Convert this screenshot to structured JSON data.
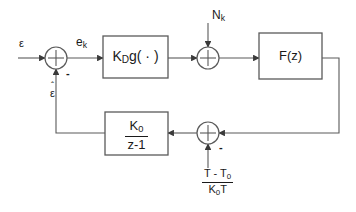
{
  "diagram": {
    "stroke_color": "#5a5a5a",
    "text_color": "#1a1a1a",
    "background": "#ffffff",
    "blocks": [
      {
        "id": "detector",
        "label_main": "K",
        "label_sub": "D",
        "label_tail": "g( · )",
        "x": 103,
        "y": 36,
        "w": 65,
        "h": 42
      },
      {
        "id": "filter",
        "label_main": "F(z)",
        "x": 259,
        "y": 33,
        "w": 63,
        "h": 46
      },
      {
        "id": "nco",
        "num_main": "K",
        "num_sub": "0",
        "den": "z-1",
        "x": 105,
        "y": 112,
        "w": 63,
        "h": 43
      }
    ],
    "summers": [
      {
        "id": "error-summer",
        "cx": 56,
        "cy": 58,
        "r": 11
      },
      {
        "id": "noise-summer",
        "cx": 208,
        "cy": 58,
        "r": 11
      },
      {
        "id": "offset-summer",
        "cx": 208,
        "cy": 133,
        "r": 11
      }
    ],
    "signal_labels": {
      "input_epsilon": "ε",
      "error_ek_main": "e",
      "error_ek_sub": "k",
      "noise_main": "N",
      "noise_sub": "k",
      "estimate_hat": "ˆ",
      "estimate_epsilon": "ε",
      "minus_error": "-",
      "minus_offset": "-",
      "offset_num": "T - T",
      "offset_num_sub": "0",
      "offset_den_main": "K",
      "offset_den_sub": "0",
      "offset_den_tail": "T"
    }
  }
}
